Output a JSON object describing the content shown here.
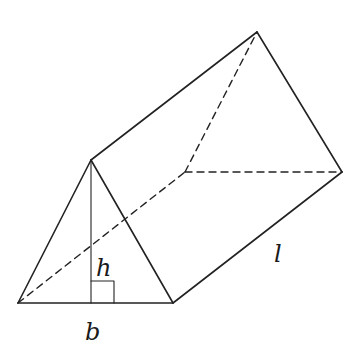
{
  "diagram": {
    "type": "triangular-prism",
    "stroke_color": "#222222",
    "background": "#ffffff",
    "labels": {
      "height": "h",
      "base": "b",
      "length": "l"
    },
    "vertices": {
      "front_left": [
        18,
        303
      ],
      "front_apex": [
        91,
        160
      ],
      "front_right": [
        173,
        303
      ],
      "back_left": [
        185,
        172
      ],
      "back_apex": [
        257,
        32
      ],
      "back_right": [
        342,
        172
      ],
      "altitude_foot": [
        91,
        303
      ]
    },
    "edges": {
      "solid": [
        [
          "front_left",
          "front_right"
        ],
        [
          "front_left",
          "front_apex"
        ],
        [
          "front_apex",
          "front_right"
        ],
        [
          "front_apex",
          "back_apex"
        ],
        [
          "back_apex",
          "back_right"
        ],
        [
          "front_right",
          "back_right"
        ]
      ],
      "dashed": [
        [
          "front_left",
          "back_left"
        ],
        [
          "back_left",
          "back_apex"
        ],
        [
          "back_left",
          "back_right"
        ]
      ],
      "altitude": [
        [
          "front_apex",
          "altitude_foot"
        ]
      ]
    },
    "right_angle_marker": {
      "x": 91,
      "y": 281,
      "size": 22
    }
  }
}
